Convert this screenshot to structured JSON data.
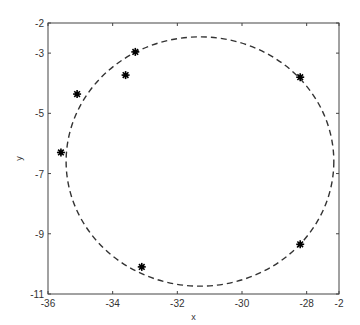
{
  "chart_data": {
    "type": "scatter",
    "title": "",
    "xlabel": "x",
    "ylabel": "y",
    "xlim": [
      -36,
      -27
    ],
    "ylim": [
      -11,
      -2
    ],
    "grid": false,
    "x_ticks": [
      "-36",
      "-34",
      "-32",
      "-30",
      "-28",
      "-2"
    ],
    "y_ticks": [
      "-2",
      "-3",
      "-5",
      "-7",
      "-9",
      "-11"
    ],
    "series": [
      {
        "name": "points",
        "marker": "asterisk",
        "color": "#000000",
        "x": [
          -35.1,
          -35.6,
          -33.6,
          -33.3,
          -28.2,
          -28.2,
          -33.1
        ],
        "y": [
          -4.36,
          -6.3,
          -3.73,
          -2.96,
          -3.8,
          -9.35,
          -10.1
        ]
      },
      {
        "name": "fitted circle",
        "style": "dashed",
        "color": "#333333",
        "center": [
          -31.3,
          -6.6
        ],
        "radius": 4.14
      }
    ]
  }
}
